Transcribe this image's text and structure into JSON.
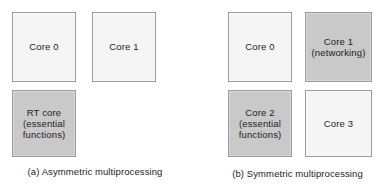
{
  "figure": {
    "background_color": "#ffffff",
    "border_color": "#9b9b9b",
    "fill_light": "#f5f5f5",
    "fill_gray": "#c9c9c9"
  },
  "panels": [
    {
      "id": "asymmetric",
      "caption": "(a) Asymmetric multiprocessing",
      "boxes": [
        {
          "name": "core-0",
          "label": "Core 0",
          "fill": "light"
        },
        {
          "name": "core-1",
          "label": "Core 1",
          "fill": "light"
        },
        {
          "name": "rt-core",
          "label": "RT core\n(essential\nfunctions)",
          "fill": "gray"
        }
      ]
    },
    {
      "id": "symmetric",
      "caption": "(b) Symmetric multiprocessing",
      "boxes": [
        {
          "name": "core-0",
          "label": "Core 0",
          "fill": "light"
        },
        {
          "name": "core-1",
          "label": "Core 1\n(networking)",
          "fill": "gray"
        },
        {
          "name": "core-2",
          "label": "Core 2\n(essential\nfunctions)",
          "fill": "gray"
        },
        {
          "name": "core-3",
          "label": "Core 3",
          "fill": "light"
        }
      ]
    }
  ]
}
